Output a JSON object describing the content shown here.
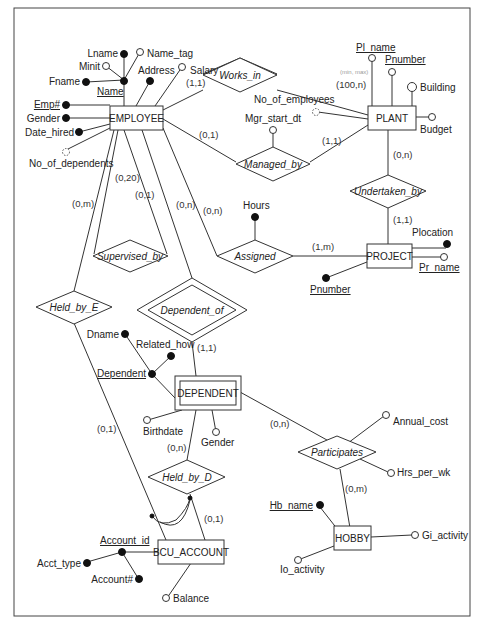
{
  "diagram": {
    "type": "ER diagram",
    "entities": [
      {
        "id": "employee",
        "label": "EMPLOYEE"
      },
      {
        "id": "plant",
        "label": "PLANT"
      },
      {
        "id": "project",
        "label": "PROJECT"
      },
      {
        "id": "dependent",
        "label": "DEPENDENT",
        "weak": true
      },
      {
        "id": "hobby",
        "label": "HOBBY"
      },
      {
        "id": "bcu_account",
        "label": "BCU_ACCOUNT"
      }
    ],
    "relationships": [
      {
        "id": "works_in",
        "label": "Works_in"
      },
      {
        "id": "managed_by",
        "label": "Managed_by"
      },
      {
        "id": "undertaken_by",
        "label": "Undertaken_by"
      },
      {
        "id": "assigned",
        "label": "Assigned"
      },
      {
        "id": "supervised_by",
        "label": "Supervised_by"
      },
      {
        "id": "held_by_e",
        "label": "Held_by_E"
      },
      {
        "id": "dependent_of",
        "label": "Dependent_of",
        "identifying": true
      },
      {
        "id": "held_by_d",
        "label": "Held_by_D"
      },
      {
        "id": "participates",
        "label": "Participates"
      }
    ],
    "attributes": {
      "lname": "Lname",
      "name_tag": "Name_tag",
      "minit": "Minit",
      "fname": "Fname",
      "name": "Name",
      "address": "Address",
      "salary": "Salary",
      "emp_no": "Emp#",
      "gender": "Gender",
      "date_hired": "Date_hired",
      "no_of_dependents": "No_of_dependents",
      "pl_name": "Pl_name",
      "pnumber_plant": "Pnumber",
      "building": "Building",
      "budget": "Budget",
      "no_of_employees": "No_of_employees",
      "mgr_start_dt": "Mgr_start_dt",
      "hours": "Hours",
      "plocation": "Plocation",
      "pr_name": "Pr_name",
      "pnumber_project": "Pnumber",
      "dname": "Dname",
      "related_how": "Related_how",
      "dependent": "Dependent",
      "birthdate": "Birthdate",
      "dep_gender": "Gender",
      "annual_cost": "Annual_cost",
      "hrs_per_wk": "Hrs_per_wk",
      "hb_name": "Hb_name",
      "gi_activity": "Gi_activity",
      "io_activity": "Io_activity",
      "account_id": "Account_id",
      "acct_type": "Acct_type",
      "account_no": "Account#",
      "balance": "Balance"
    },
    "cardinalities": {
      "emp_works_in": "(1,1)",
      "plant_works_in": "(100,n)",
      "emp_managed_by": "(0,1)",
      "plant_managed_by": "(1,1)",
      "plant_undertaken_by": "(0,n)",
      "project_undertaken_by": "(1,1)",
      "emp_supervised_a": "(0,20)",
      "emp_supervised_b": "(0,1)",
      "emp_held_by_e": "(0,m)",
      "emp_dependent_of": "(0,n)",
      "emp_assigned": "(0,n)",
      "project_assigned": "(1,m)",
      "dependent_dependent_of": "(1,1)",
      "account_held_by_e": "(0,1)",
      "dependent_held_by_d": "(0,n)",
      "account_held_by_d": "(0,1)",
      "dependent_participates": "(0,n)",
      "hobby_participates": "(0,m)"
    },
    "handwritten_note": "(min, max)"
  }
}
